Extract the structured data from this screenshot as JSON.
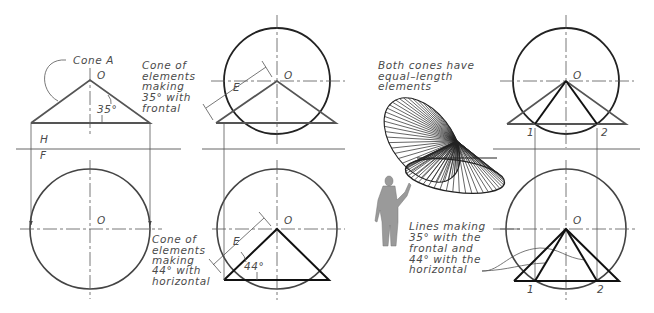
{
  "figure": {
    "reference_line": {
      "upper": "H",
      "lower": "F"
    },
    "view1": {
      "callout": "Cone A",
      "apex_label": "O",
      "angle_label": "35°",
      "side_note": [
        "Cone of",
        "elements",
        "making",
        "35° with",
        "frontal"
      ],
      "bottom_apex_label": "O"
    },
    "view2": {
      "top_apex_label": "O",
      "top_length_label": "E",
      "bottom_apex_label": "O",
      "bottom_length_label": "E",
      "angle_label": "44°",
      "side_note": [
        "Cone of",
        "elements",
        "making",
        "44° with",
        "horizontal"
      ]
    },
    "pictorial": {
      "note": [
        "Both cones have",
        "equal–length",
        "elements"
      ],
      "lines_note": [
        "Lines making",
        "35° with the",
        "frontal and",
        "44° with the",
        "horizontal"
      ]
    },
    "view3": {
      "top_apex_label": "O",
      "point1": "1",
      "point2": "2",
      "bottom_apex_label": "O",
      "bottom_point1": "1",
      "bottom_point2": "2"
    },
    "colors": {
      "line": "#222222",
      "text": "#4a4a4a",
      "background": "#ffffff"
    }
  }
}
